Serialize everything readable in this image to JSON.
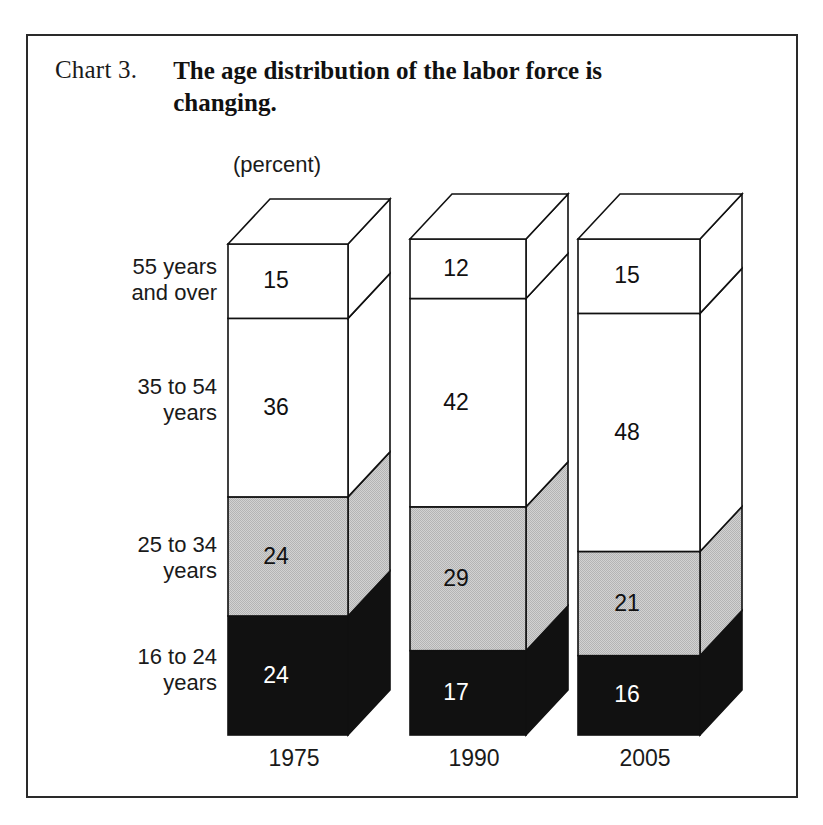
{
  "frame": {
    "border_color": "#2a2a2a"
  },
  "header": {
    "chart_number": "Chart 3.",
    "title_line1": "The age distribution of the labor force is",
    "title_line2": "changing."
  },
  "axis_note": "(percent)",
  "category_labels": [
    {
      "line1": "55 years",
      "line2": "and over"
    },
    {
      "line1": "35 to 54",
      "line2": "years"
    },
    {
      "line1": "25 to 34",
      "line2": "years"
    },
    {
      "line1": "16 to 24",
      "line2": "years"
    }
  ],
  "colors": {
    "white": "#ffffff",
    "gray": "#c9c9c9",
    "gray_side": "#c9c9c9",
    "black": "#111111",
    "outline": "#111111",
    "label_dark": "#111111",
    "label_light": "#ffffff"
  },
  "chart_data": {
    "type": "bar",
    "subtype": "stacked-3d-column",
    "title": "The age distribution of the labor force is changing.",
    "subtitle": "Chart 3.",
    "xlabel": "",
    "ylabel": "(percent)",
    "grid": false,
    "legend_position": "left-axis-labels",
    "ylim": [
      0,
      100
    ],
    "categories": [
      "1975",
      "1990",
      "2005"
    ],
    "series": [
      {
        "name": "16 to 24 years",
        "fill": "#111111",
        "text_color": "#ffffff",
        "values": [
          24,
          17,
          16
        ]
      },
      {
        "name": "25 to 34 years",
        "fill": "#c9c9c9",
        "text_color": "#111111",
        "values": [
          24,
          29,
          21
        ]
      },
      {
        "name": "35 to 54 years",
        "fill": "#ffffff",
        "text_color": "#111111",
        "values": [
          36,
          42,
          48
        ]
      },
      {
        "name": "55 years and over",
        "fill": "#ffffff",
        "text_color": "#111111",
        "values": [
          15,
          12,
          15
        ]
      }
    ],
    "stack_totals": [
      99,
      100,
      100
    ],
    "value_labels": {
      "1975": {
        "55 years and over": 15,
        "35 to 54 years": 36,
        "25 to 34 years": 24,
        "16 to 24 years": 24
      },
      "1990": {
        "55 years and over": 12,
        "35 to 54 years": 42,
        "25 to 34 years": 29,
        "16 to 24 years": 17
      },
      "2005": {
        "55 years and over": 15,
        "35 to 54 years": 48,
        "25 to 34 years": 21,
        "16 to 24 years": 16
      }
    }
  },
  "geometry": {
    "baseline_y": 735,
    "unit_px": 4.96,
    "depth_x": 42,
    "depth_y": 45,
    "bars": [
      {
        "x": 228,
        "w": 120
      },
      {
        "x": 410,
        "w": 116
      },
      {
        "x": 578,
        "w": 122
      }
    ],
    "xtick_y": 766
  }
}
